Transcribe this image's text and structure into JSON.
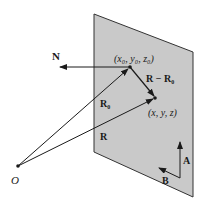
{
  "diagram": {
    "plane": {
      "fill": "#c9c9c9",
      "stroke": "#333333",
      "corners": [
        [
          94,
          14
        ],
        [
          193,
          52
        ],
        [
          193,
          197
        ],
        [
          94,
          152
        ]
      ]
    },
    "points": {
      "origin": {
        "label": "O",
        "x": 18,
        "y": 166
      },
      "p0": {
        "label": "(x₀, y₀, z₀)",
        "x": 130,
        "y": 67
      },
      "p": {
        "label": "(x, y, z)",
        "x": 155,
        "y": 98
      }
    },
    "vectors": {
      "N": {
        "label": "N",
        "from": [
          130,
          67
        ],
        "to": [
          58,
          67
        ]
      },
      "R0": {
        "label": "R₀",
        "from": [
          18,
          166
        ],
        "to": [
          130,
          67
        ]
      },
      "R": {
        "label": "R",
        "from": [
          18,
          166
        ],
        "to": [
          155,
          98
        ]
      },
      "RminusR0": {
        "label": "R − R₀",
        "from": [
          130,
          67
        ],
        "to": [
          155,
          98
        ]
      },
      "A": {
        "label": "A",
        "from": [
          180,
          178
        ],
        "to": [
          180,
          141
        ]
      },
      "B": {
        "label": "B",
        "from": [
          180,
          178
        ],
        "to": [
          158,
          167
        ]
      }
    },
    "colors": {
      "line": "#1a1a1a",
      "plane": "#c9c9c9",
      "background": "#ffffff"
    }
  }
}
